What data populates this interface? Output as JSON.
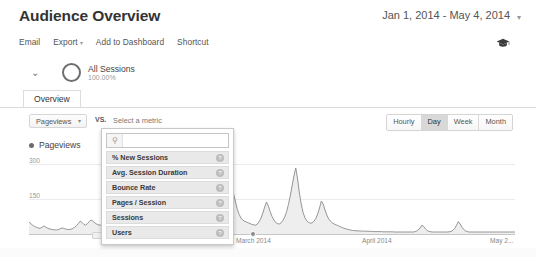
{
  "header": {
    "title": "Audience Overview",
    "date_range": "Jan 1, 2014 - May 4, 2014",
    "date_caret": "▾"
  },
  "toolbar": {
    "items": [
      {
        "label": "Email",
        "caret": ""
      },
      {
        "label": "Export",
        "caret": "▾"
      },
      {
        "label": "Add to Dashboard",
        "caret": ""
      },
      {
        "label": "Shortcut",
        "caret": ""
      }
    ],
    "learn_icon": "graduation-cap-icon"
  },
  "segment": {
    "caret": "⌄",
    "name": "All Sessions",
    "percent": "100.00%"
  },
  "tabs": [
    {
      "label": "Overview",
      "active": true
    }
  ],
  "metric_selector": {
    "primary_metric": "Pageviews",
    "primary_caret": "▾",
    "vs_label": "VS.",
    "secondary_placeholder": "Select a metric"
  },
  "metric_dropdown": {
    "search_value": "",
    "search_placeholder": "",
    "search_icon": "search-icon",
    "help_glyph": "?",
    "options": [
      "% New Sessions",
      "Avg. Session Duration",
      "Bounce Rate",
      "Pages / Session",
      "Sessions",
      "Users"
    ]
  },
  "granularity": {
    "options": [
      "Hourly",
      "Day",
      "Week",
      "Month"
    ],
    "selected": "Day"
  },
  "chart_data": {
    "type": "area",
    "title": "",
    "xlabel": "",
    "ylabel": "Pageviews",
    "legend": [
      "Pageviews"
    ],
    "legend_position": "top-left",
    "grid": true,
    "ylim": [
      0,
      450
    ],
    "yticks": [
      150,
      300
    ],
    "ytick_labels": [
      "150",
      "300"
    ],
    "xtick_labels": [
      "March 2014",
      "April 2014",
      "May 2..."
    ],
    "xtick_positions": [
      0.43,
      0.7,
      0.965
    ],
    "series_color": "#8a8a8a",
    "fill_color": "#eeeeee",
    "x_start": "Jan 1, 2014",
    "x_end": "May 4, 2014",
    "values": [
      60,
      52,
      44,
      38,
      34,
      30,
      28,
      33,
      40,
      36,
      30,
      26,
      24,
      22,
      21,
      20,
      22,
      26,
      30,
      28,
      25,
      23,
      22,
      24,
      28,
      34,
      42,
      52,
      64,
      58,
      48,
      44,
      52,
      62,
      70,
      64,
      56,
      50,
      46,
      44,
      48,
      54,
      60,
      58,
      52,
      46,
      42,
      40,
      44,
      50,
      56,
      62,
      58,
      52,
      48,
      46,
      50,
      58,
      66,
      72,
      68,
      60,
      54,
      50,
      56,
      66,
      78,
      90,
      120,
      175,
      250,
      320,
      260,
      170,
      110,
      80,
      66,
      58,
      54,
      60,
      72,
      92,
      110,
      96,
      78,
      66,
      60,
      58,
      62,
      70,
      80,
      92,
      100,
      112,
      125,
      140,
      160,
      185,
      215,
      180,
      145,
      118,
      96,
      80,
      70,
      66,
      72,
      86,
      110,
      145,
      185,
      225,
      200,
      160,
      124,
      98,
      80,
      70,
      64,
      60,
      56,
      52,
      48,
      46,
      44,
      50,
      62,
      80,
      105,
      135,
      160,
      140,
      112,
      88,
      70,
      58,
      52,
      50,
      56,
      68,
      86,
      112,
      148,
      190,
      240,
      290,
      330,
      275,
      205,
      150,
      108,
      82,
      66,
      58,
      54,
      56,
      64,
      78,
      100,
      130,
      165,
      150,
      120,
      95,
      76,
      64,
      56,
      50,
      46,
      42,
      38,
      34,
      30,
      27,
      24,
      22,
      20,
      18,
      17,
      16,
      16,
      15,
      15,
      14,
      14,
      14,
      13,
      13,
      13,
      12,
      12,
      12,
      12,
      12,
      11,
      11,
      11,
      11,
      11,
      11,
      10,
      10,
      10,
      10,
      10,
      10,
      10,
      10,
      10,
      10,
      10,
      11,
      14,
      20,
      30,
      44,
      38,
      26,
      17,
      13,
      11,
      10,
      10,
      10,
      10,
      10,
      10,
      10,
      10,
      10,
      11,
      13,
      18,
      28,
      44,
      62,
      50,
      34,
      22,
      15,
      12,
      10,
      10,
      10,
      10,
      10,
      10,
      10,
      10,
      10,
      10,
      10,
      10,
      10,
      10,
      10,
      10,
      10,
      10,
      10,
      10,
      10,
      10,
      10,
      10,
      10,
      10
    ]
  },
  "scrollbar": {
    "orientation": "horizontal"
  }
}
